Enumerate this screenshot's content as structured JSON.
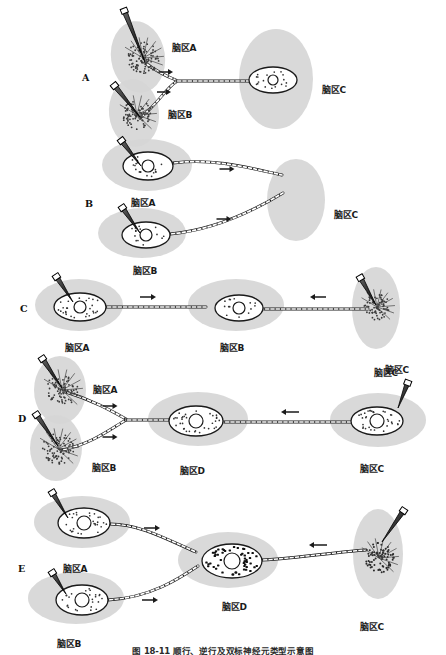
{
  "figure": {
    "caption": "图 18-11  顺行、逆行及双标神经元类型示意图",
    "background_color": "#ffffff",
    "tissue_color": "#d6d6d6",
    "ink_color": "#1a1a1a",
    "width": 446,
    "height": 654
  },
  "region_labels": {
    "a": "脑区A",
    "b": "脑区B",
    "c": "脑区C",
    "d": "脑区D"
  },
  "panels": [
    {
      "letter": "A",
      "letter_x": 82,
      "letter_y": 72,
      "description": "anterograde-convergent-two-sources-one-target",
      "injection_sites": [
        {
          "name": "脑区A",
          "cx": 138,
          "cy": 57,
          "rx": 27,
          "ry": 36,
          "rot": -8,
          "pipette": {
            "x1": 124,
            "y1": 10,
            "x2": 145,
            "y2": 62,
            "w": 5
          },
          "stipple": {
            "cx": 143,
            "cy": 58,
            "r": 16,
            "n": 90,
            "dot": 0.9,
            "color": "#3a3a3a"
          },
          "label_x": 172,
          "label_y": 41
        },
        {
          "name": "脑区B",
          "cx": 134,
          "cy": 113,
          "rx": 25,
          "ry": 34,
          "rot": -6,
          "pipette": {
            "x1": 114,
            "y1": 85,
            "x2": 140,
            "y2": 117,
            "w": 5
          },
          "stipple": {
            "cx": 137,
            "cy": 115,
            "r": 15,
            "n": 85,
            "dot": 0.9,
            "color": "#3a3a3a"
          },
          "label_x": 168,
          "label_y": 108
        },
        {
          "name": "脑区C",
          "cx": 276,
          "cy": 79,
          "rx": 37,
          "ry": 50,
          "rot": 0,
          "soma": {
            "cx": 273,
            "cy": 80,
            "rx": 24,
            "ry": 13,
            "nuc_r": 5
          },
          "label_x": 322,
          "label_y": 83
        }
      ],
      "axons": [
        {
          "path": "M145,63 C158,72 165,76 176,80",
          "beads": true
        },
        {
          "path": "M140,118 C158,104 166,88 176,82",
          "beads": true
        },
        {
          "path": "M176,81 L249,81",
          "beads": true
        }
      ],
      "arrows": [
        {
          "x": 166,
          "y": 72,
          "dir": "right",
          "len": 14
        },
        {
          "x": 164,
          "y": 92,
          "dir": "right",
          "len": 14
        }
      ]
    },
    {
      "letter": "B",
      "letter_x": 85,
      "letter_y": 198,
      "description": "retrograde-two-somata-project-to-one-target",
      "injection_sites": [
        {
          "name": "脑区A",
          "cx": 147,
          "cy": 165,
          "rx": 45,
          "ry": 26,
          "rot": 0,
          "pipette": {
            "x1": 121,
            "y1": 140,
            "x2": 141,
            "y2": 166,
            "w": 5
          },
          "soma": {
            "cx": 148,
            "cy": 166,
            "rx": 25,
            "ry": 14,
            "nuc_r": 6
          },
          "label_x": 131,
          "label_y": 196
        },
        {
          "name": "脑区B",
          "cx": 142,
          "cy": 233,
          "rx": 44,
          "ry": 25,
          "rot": 0,
          "pipette": {
            "x1": 122,
            "y1": 207,
            "x2": 140,
            "y2": 233,
            "w": 5
          },
          "soma": {
            "cx": 146,
            "cy": 235,
            "rx": 24,
            "ry": 13,
            "nuc_r": 6
          },
          "label_x": 133,
          "label_y": 264
        },
        {
          "name": "脑区C",
          "cx": 296,
          "cy": 200,
          "rx": 29,
          "ry": 41,
          "rot": 0,
          "label_x": 334,
          "label_y": 208
        }
      ],
      "axons": [
        {
          "path": "M173,163 C215,158 250,168 282,175",
          "beads": true
        },
        {
          "path": "M170,234 C215,230 255,210 283,193",
          "beads": true
        }
      ],
      "arrows": [
        {
          "x": 227,
          "y": 169,
          "dir": "right",
          "len": 15
        },
        {
          "x": 224,
          "y": 219,
          "dir": "right",
          "len": 15
        }
      ]
    },
    {
      "letter": "C",
      "letter_x": 20,
      "letter_y": 303,
      "description": "anterograde-and-retrograde-onto-middle-region",
      "injection_sites": [
        {
          "name": "脑区A",
          "cx": 79,
          "cy": 305,
          "rx": 44,
          "ry": 26,
          "rot": 0,
          "pipette": {
            "x1": 56,
            "y1": 276,
            "x2": 73,
            "y2": 302,
            "w": 5
          },
          "soma": {
            "cx": 80,
            "cy": 307,
            "rx": 26,
            "ry": 14,
            "nuc_r": 6,
            "stipple": true
          },
          "label_x": 65,
          "label_y": 341
        },
        {
          "name": "脑区B",
          "cx": 236,
          "cy": 305,
          "rx": 48,
          "ry": 26,
          "rot": 0,
          "soma": {
            "cx": 239,
            "cy": 308,
            "rx": 24,
            "ry": 13,
            "nuc_r": 6
          },
          "label_x": 220,
          "label_y": 341
        },
        {
          "name": "脑区C",
          "cx": 376,
          "cy": 308,
          "rx": 24,
          "ry": 41,
          "rot": 0,
          "pipette": {
            "x1": 360,
            "y1": 277,
            "x2": 376,
            "y2": 305,
            "w": 5
          },
          "stipple": {
            "cx": 377,
            "cy": 307,
            "r": 13,
            "n": 70,
            "dot": 0.9,
            "color": "#3a3a3a"
          },
          "label_x": 385,
          "label_y": 363
        }
      ],
      "axons": [
        {
          "path": "M106,307 L206,307",
          "beads": true
        },
        {
          "path": "M264,309 L368,309",
          "beads": true
        }
      ],
      "arrows": [
        {
          "x": 148,
          "y": 297,
          "dir": "right",
          "len": 16
        },
        {
          "x": 318,
          "y": 297,
          "dir": "left",
          "len": 16
        }
      ]
    },
    {
      "letter": "D",
      "letter_x": 18,
      "letter_y": 413,
      "description": "convergence-onto-region-D-with-retrograde-from-C",
      "injection_sites": [
        {
          "name": "脑区A",
          "cx": 60,
          "cy": 390,
          "rx": 26,
          "ry": 34,
          "rot": 0,
          "pipette": {
            "x1": 42,
            "y1": 358,
            "x2": 62,
            "y2": 388,
            "w": 5
          },
          "stipple": {
            "cx": 62,
            "cy": 390,
            "r": 16,
            "n": 80,
            "dot": 0.9,
            "color": "#3a3a3a"
          },
          "label_x": 93,
          "label_y": 383
        },
        {
          "name": "脑区B",
          "cx": 56,
          "cy": 448,
          "rx": 26,
          "ry": 33,
          "rot": 0,
          "pipette": {
            "x1": 36,
            "y1": 414,
            "x2": 58,
            "y2": 446,
            "w": 5
          },
          "stipple": {
            "cx": 58,
            "cy": 449,
            "r": 16,
            "n": 80,
            "dot": 0.9,
            "color": "#3a3a3a"
          },
          "label_x": 92,
          "label_y": 461
        },
        {
          "name": "脑区D",
          "cx": 198,
          "cy": 419,
          "rx": 50,
          "ry": 27,
          "rot": 0,
          "soma": {
            "cx": 196,
            "cy": 421,
            "rx": 27,
            "ry": 15,
            "nuc_r": 7,
            "stipple": true
          },
          "label_x": 180,
          "label_y": 464
        },
        {
          "name": "脑区C",
          "cx": 378,
          "cy": 420,
          "rx": 48,
          "ry": 27,
          "rot": 0,
          "pipette": {
            "x1": 408,
            "y1": 382,
            "x2": 398,
            "y2": 408,
            "w": 5
          },
          "soma": {
            "cx": 377,
            "cy": 421,
            "rx": 26,
            "ry": 14,
            "nuc_r": 7,
            "stipple": true
          },
          "label_x": 360,
          "label_y": 462
        },
        {
          "name": "脑区C",
          "label_only": true,
          "label_x": 374,
          "label_y": 366
        }
      ],
      "axons": [
        {
          "path": "M66,392 C92,400 110,410 126,419",
          "beads": true
        },
        {
          "path": "M62,450 C92,444 112,428 126,420",
          "beads": true
        },
        {
          "path": "M126,420 L170,420",
          "beads": true
        },
        {
          "path": "M224,422 L352,422",
          "beads": true
        }
      ],
      "arrows": [
        {
          "x": 110,
          "y": 406,
          "dir": "right",
          "len": 15
        },
        {
          "x": 110,
          "y": 437,
          "dir": "right",
          "len": 15
        },
        {
          "x": 290,
          "y": 412,
          "dir": "left",
          "len": 18
        }
      ]
    },
    {
      "letter": "E",
      "letter_x": 18,
      "letter_y": 563,
      "description": "double-labeled-neuron-in-region-D",
      "injection_sites": [
        {
          "name": "脑区A",
          "cx": 82,
          "cy": 522,
          "rx": 48,
          "ry": 26,
          "rot": 0,
          "pipette": {
            "x1": 52,
            "y1": 492,
            "x2": 68,
            "y2": 518,
            "w": 5
          },
          "soma": {
            "cx": 84,
            "cy": 523,
            "rx": 26,
            "ry": 15,
            "nuc_r": 7,
            "stipple": true
          },
          "label_x": 63,
          "label_y": 562
        },
        {
          "name": "脑区B",
          "cx": 76,
          "cy": 598,
          "rx": 48,
          "ry": 26,
          "rot": 0,
          "pipette": {
            "x1": 52,
            "y1": 572,
            "x2": 66,
            "y2": 594,
            "w": 5
          },
          "soma": {
            "cx": 82,
            "cy": 600,
            "rx": 26,
            "ry": 15,
            "nuc_r": 7,
            "stipple": true
          },
          "label_x": 57,
          "label_y": 637
        },
        {
          "name": "脑区D",
          "cx": 228,
          "cy": 560,
          "rx": 50,
          "ry": 28,
          "rot": 0,
          "soma": {
            "cx": 232,
            "cy": 561,
            "rx": 30,
            "ry": 17,
            "nuc_r": 8,
            "dense": true
          },
          "label_x": 222,
          "label_y": 600
        },
        {
          "name": "脑区C",
          "cx": 378,
          "cy": 554,
          "rx": 25,
          "ry": 45,
          "rot": 0,
          "pipette": {
            "x1": 404,
            "y1": 510,
            "x2": 382,
            "y2": 542,
            "w": 5
          },
          "stipple": {
            "cx": 379,
            "cy": 558,
            "r": 15,
            "n": 80,
            "dot": 1.0,
            "color": "#2a2a2a"
          },
          "label_x": 360,
          "label_y": 620
        }
      ],
      "axons": [
        {
          "path": "M110,524 C140,524 168,540 196,552",
          "beads": true
        },
        {
          "path": "M108,600 C150,598 180,578 198,566",
          "beads": true
        },
        {
          "path": "M262,560 C300,558 336,552 366,550",
          "beads": true
        }
      ],
      "arrows": [
        {
          "x": 152,
          "y": 528,
          "dir": "right",
          "len": 16
        },
        {
          "x": 150,
          "y": 600,
          "dir": "right",
          "len": 16
        },
        {
          "x": 318,
          "y": 545,
          "dir": "left",
          "len": 18
        }
      ]
    }
  ]
}
